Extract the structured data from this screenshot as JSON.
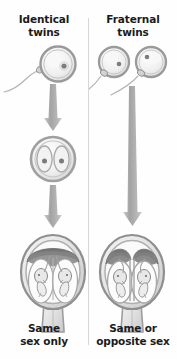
{
  "diagram": {
    "title_semantic": "identical-vs-fraternal-twins-development-diagram",
    "background_color": "#fefefe",
    "text_color": "#1b1b1b",
    "divider_color": "#d6d6d6",
    "arrow_color": "#a9a9a9"
  },
  "columns": [
    {
      "id": "identical",
      "heading": "Identical\ntwins",
      "heading_line1": "Identical",
      "heading_line2": "twins",
      "caption": "Same\nsex only",
      "caption_line1": "Same",
      "caption_line2": "sex only",
      "stages": [
        {
          "name": "fertilization",
          "description": "one sperm fertilizing one egg",
          "egg_count": 1,
          "sperm_count": 1
        },
        {
          "name": "zygote-division",
          "description": "single zygote dividing into two cells",
          "cell_count": 2
        },
        {
          "name": "uterus-with-twins",
          "description": "uterus with two fetuses sharing one placenta",
          "fetus_count": 2,
          "placenta_count": 1
        }
      ],
      "arrows": 2
    },
    {
      "id": "fraternal",
      "heading": "Fraternal\ntwins",
      "heading_line1": "Fraternal",
      "heading_line2": "twins",
      "caption": "Same or\nopposite sex",
      "caption_line1": "Same or",
      "caption_line2": "opposite sex",
      "stages": [
        {
          "name": "fertilization",
          "description": "two sperm fertilizing two separate eggs",
          "egg_count": 2,
          "sperm_count": 2
        },
        {
          "name": "uterus-with-twins",
          "description": "uterus with two fetuses each with own placenta",
          "fetus_count": 2,
          "placenta_count": 2
        }
      ],
      "arrows": 1
    }
  ]
}
